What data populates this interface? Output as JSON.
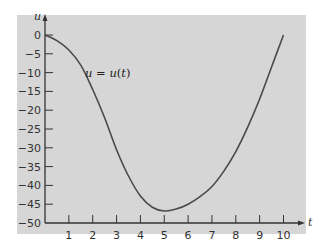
{
  "chart_data": {
    "type": "line",
    "title": "",
    "xlabel": "t",
    "ylabel": "u",
    "xlim": [
      0,
      10
    ],
    "ylim": [
      -50,
      0
    ],
    "xticks": [
      1,
      2,
      3,
      4,
      5,
      6,
      7,
      8,
      9,
      10
    ],
    "yticks": [
      0,
      -5,
      -10,
      -15,
      -20,
      -25,
      -30,
      -35,
      -40,
      -45,
      -50
    ],
    "grid": false,
    "annotations": [
      {
        "text": "u = u(t)",
        "t": 1.7,
        "u": -10
      }
    ],
    "series": [
      {
        "name": "u = u(t)",
        "x": [
          0,
          0.5,
          1,
          1.5,
          2,
          2.5,
          3,
          3.5,
          4,
          4.5,
          5,
          5.5,
          6,
          6.5,
          7,
          7.5,
          8,
          8.5,
          9,
          9.5,
          10
        ],
        "values": [
          0,
          -1.5,
          -4,
          -8,
          -14.5,
          -22,
          -30.5,
          -37.5,
          -42.8,
          -45.8,
          -46.8,
          -46.3,
          -45,
          -43,
          -40.3,
          -36.2,
          -31,
          -24.5,
          -17,
          -8.5,
          0
        ]
      }
    ]
  },
  "labels": {
    "x_axis_var": "t",
    "y_axis_var": "u",
    "curve_label": "u = u(t)"
  },
  "colors": {
    "background": "#d6d6d6",
    "curve": "#4a4a4a",
    "axis": "#333333"
  }
}
